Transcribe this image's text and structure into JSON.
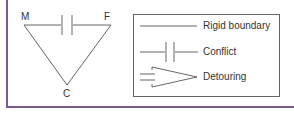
{
  "diagram": {
    "triangle": {
      "vertices": [
        {
          "id": "M",
          "label": "M"
        },
        {
          "id": "F",
          "label": "F"
        },
        {
          "id": "C",
          "label": "C"
        }
      ],
      "edges": [
        {
          "from": "M",
          "to": "F",
          "type": "Conflict"
        },
        {
          "from": "M",
          "to": "C",
          "type": "Rigid boundary"
        },
        {
          "from": "F",
          "to": "C",
          "type": "Rigid boundary"
        }
      ]
    },
    "legend": {
      "items": [
        {
          "symbol": "solid-line",
          "label": "Rigid boundary"
        },
        {
          "symbol": "conflict-bars",
          "label": "Conflict"
        },
        {
          "symbol": "detour-arrow",
          "label": "Detouring"
        }
      ]
    },
    "colors": {
      "line": "#555555",
      "frame": "#7b5a8e",
      "text": "#333333"
    }
  }
}
